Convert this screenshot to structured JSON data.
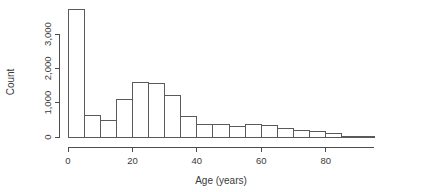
{
  "chart_data": {
    "type": "bar",
    "title": "",
    "subtitle": "",
    "xlabel": "Age (years)",
    "ylabel": "Count",
    "xlim": [
      0,
      95
    ],
    "ylim": [
      0,
      3700
    ],
    "grid": false,
    "legend": null,
    "bin_width": 5,
    "xticks": [
      0,
      20,
      40,
      60,
      80
    ],
    "xtick_labels": [
      "0",
      "20",
      "40",
      "60",
      "80"
    ],
    "yticks": [
      0,
      1000,
      2000,
      3000
    ],
    "ytick_labels": [
      "0",
      "1,000",
      "2,000",
      "3,000"
    ],
    "bin_starts": [
      0,
      5,
      10,
      15,
      20,
      25,
      30,
      35,
      40,
      45,
      50,
      55,
      60,
      65,
      70,
      75,
      80,
      85,
      90
    ],
    "bin_ends": [
      5,
      10,
      15,
      20,
      25,
      30,
      35,
      40,
      45,
      50,
      55,
      60,
      65,
      70,
      75,
      80,
      85,
      90,
      95
    ],
    "categories": [
      "0-5",
      "5-10",
      "10-15",
      "15-20",
      "20-25",
      "25-30",
      "30-35",
      "35-40",
      "40-45",
      "45-50",
      "50-55",
      "55-60",
      "60-65",
      "65-70",
      "70-75",
      "75-80",
      "80-85",
      "85-90",
      "90-95"
    ],
    "values": [
      3700,
      620,
      470,
      1080,
      1580,
      1560,
      1220,
      590,
      350,
      370,
      300,
      350,
      330,
      240,
      200,
      170,
      90,
      25,
      10
    ]
  },
  "axes": {
    "x_axis_name": "x-axis",
    "y_axis_name": "y-axis"
  }
}
